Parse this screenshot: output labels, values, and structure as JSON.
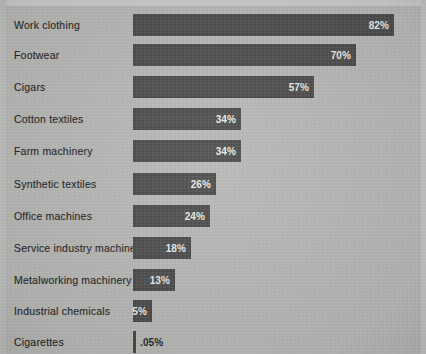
{
  "chart_data": {
    "type": "bar",
    "orientation": "horizontal",
    "title": "",
    "subtitle": "",
    "xlabel": "",
    "ylabel": "",
    "grid": false,
    "legend": "none",
    "xlim": [
      0,
      82
    ],
    "value_suffix": "%",
    "categories": [
      "Work clothing",
      "Footwear",
      "Cigars",
      "Cotton textiles",
      "Farm machinery",
      "Synthetic textiles",
      "Office machines",
      "Service industry machines",
      "Metalworking machinery",
      "Industrial chemicals",
      "Cigarettes"
    ],
    "values": [
      82,
      70,
      57,
      34,
      34,
      26,
      24,
      18,
      13,
      5,
      0.05
    ],
    "value_labels": [
      "82%",
      "70%",
      "57%",
      "34%",
      "34%",
      "26%",
      "24%",
      "18%",
      "13%",
      "5%",
      ".05%"
    ],
    "bars": [
      {
        "label": "Work clothing",
        "value": 82,
        "display": "82%",
        "width_px": 261,
        "top_px": 8,
        "label_inside": true
      },
      {
        "label": "Footwear",
        "value": 70,
        "display": "70%",
        "width_px": 223,
        "top_px": 38,
        "label_inside": true
      },
      {
        "label": "Cigars",
        "value": 57,
        "display": "57%",
        "width_px": 181,
        "top_px": 70,
        "label_inside": true
      },
      {
        "label": "Cotton textiles",
        "value": 34,
        "display": "34%",
        "width_px": 108,
        "top_px": 102,
        "label_inside": true
      },
      {
        "label": "Farm machinery",
        "value": 34,
        "display": "34%",
        "width_px": 108,
        "top_px": 134,
        "label_inside": true
      },
      {
        "label": "Synthetic textiles",
        "value": 26,
        "display": "26%",
        "width_px": 83,
        "top_px": 167,
        "label_inside": true
      },
      {
        "label": "Office machines",
        "value": 24,
        "display": "24%",
        "width_px": 77,
        "top_px": 199,
        "label_inside": true
      },
      {
        "label": "Service industry machines",
        "value": 18,
        "display": "18%",
        "width_px": 58,
        "top_px": 231,
        "label_inside": true
      },
      {
        "label": "Metalworking machinery",
        "value": 13,
        "display": "13%",
        "width_px": 42,
        "top_px": 263,
        "label_inside": true
      },
      {
        "label": "Industrial chemicals",
        "value": 5,
        "display": "5%",
        "width_px": 19,
        "top_px": 294,
        "label_inside": true
      },
      {
        "label": "Cigarettes",
        "value": 0.05,
        "display": ".05%",
        "width_px": 3,
        "top_px": 325,
        "label_inside": false
      }
    ]
  },
  "colors": {
    "background": "#b6b6b4",
    "bar": "#4c4c4c",
    "label_text": "#232323",
    "value_text_inside": "#e9e9e6",
    "value_text_outside": "#1f1f1f",
    "frame_top": "#c9c9c7"
  }
}
